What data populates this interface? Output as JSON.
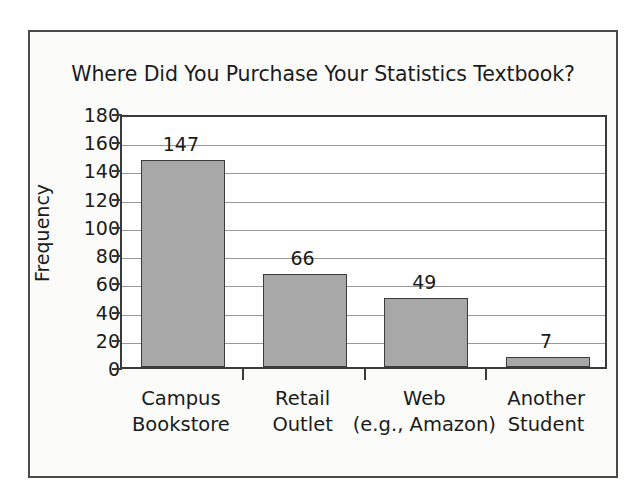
{
  "figure": {
    "background_color": "#fbfbfa",
    "frame_color": "#4a4a4a"
  },
  "chart_data": {
    "type": "bar",
    "title": "Where Did You Purchase Your Statistics Textbook?",
    "xlabel": "",
    "ylabel": "Frequency",
    "categories": [
      "Campus Bookstore",
      "Retail Outlet",
      "Web (e.g., Amazon)",
      "Another Student"
    ],
    "category_lines": [
      [
        "Campus",
        "Bookstore"
      ],
      [
        "Retail",
        "Outlet"
      ],
      [
        "Web",
        "(e.g., Amazon)"
      ],
      [
        "Another",
        "Student"
      ]
    ],
    "values": [
      147,
      66,
      49,
      7
    ],
    "value_labels": [
      "147",
      "66",
      "49",
      "7"
    ],
    "ylim": [
      0,
      180
    ],
    "ytick_step": 20,
    "yticks": [
      180,
      160,
      140,
      120,
      100,
      80,
      60,
      40,
      20,
      0
    ],
    "ytick_labels": [
      "180",
      "160",
      "140",
      "120",
      "100",
      "80",
      "60",
      "40",
      "20",
      "0"
    ],
    "grid": true,
    "grid_axis": "y",
    "legend": null,
    "bar_color": "#a8a8a8",
    "bar_edge_color": "#3c3c3c",
    "gridline_color": "#9a9a9a",
    "axis_color": "#3a3a3a"
  }
}
